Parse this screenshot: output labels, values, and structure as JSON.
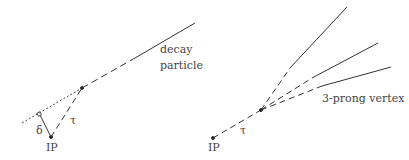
{
  "left_panel": {
    "label_decay": "decay",
    "label_particle": "particle",
    "label_delta": "δ",
    "label_tau": "τ",
    "label_ip": "IP"
  },
  "right_panel": {
    "label_vertex": "3-prong vertex",
    "label_tau": "τ",
    "label_ip": "IP"
  },
  "colors": {
    "line": "#333333",
    "text": "#444444"
  }
}
